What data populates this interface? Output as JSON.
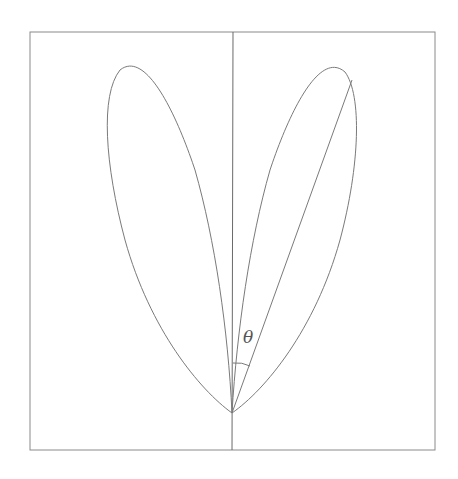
{
  "diagram": {
    "type": "polar-lobes",
    "angle_label": "θ",
    "colors": {
      "stroke": "#7a7a7a",
      "frame": "#8a8a8a",
      "background": "#ffffff"
    },
    "elements": [
      "frame",
      "vertical-axis",
      "left-lobe",
      "right-lobe",
      "radius-line",
      "angle-arc",
      "theta-label"
    ]
  }
}
